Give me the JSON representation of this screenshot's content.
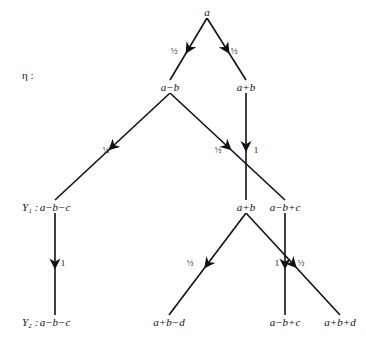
{
  "diagram": {
    "rows": [
      {
        "id": "eta",
        "label": "η :",
        "y": 75
      },
      {
        "id": "y1",
        "label": "Y₁ :",
        "y": 207
      },
      {
        "id": "y2",
        "label": "Y₂ :",
        "y": 322
      }
    ],
    "nodes": [
      {
        "id": "root",
        "label": "a",
        "x": 207,
        "y": 12
      },
      {
        "id": "eta_l",
        "label": "a−b",
        "x": 170,
        "y": 87
      },
      {
        "id": "eta_r",
        "label": "a+b",
        "x": 246,
        "y": 87
      },
      {
        "id": "y1_1",
        "label": "a−b−c",
        "x": 55,
        "y": 207
      },
      {
        "id": "y1_2",
        "label": "a+b",
        "x": 246,
        "y": 207
      },
      {
        "id": "y1_3",
        "label": "a−b+c",
        "x": 285,
        "y": 207
      },
      {
        "id": "y2_1",
        "label": "a−b−c",
        "x": 55,
        "y": 322
      },
      {
        "id": "y2_2",
        "label": "a+b−d",
        "x": 169,
        "y": 322
      },
      {
        "id": "y2_3",
        "label": "a−b+c",
        "x": 285,
        "y": 322
      },
      {
        "id": "y2_4",
        "label": "a+b+d",
        "x": 340,
        "y": 322
      }
    ],
    "edges": [
      {
        "from": "root",
        "to": "eta_l",
        "weight": "½",
        "wx": 174,
        "wy": 51
      },
      {
        "from": "root",
        "to": "eta_r",
        "weight": "½",
        "wx": 234,
        "wy": 51
      },
      {
        "from": "eta_l",
        "to": "y1_1",
        "weight": "½",
        "wx": 106,
        "wy": 150
      },
      {
        "from": "eta_l",
        "to": "y1_3",
        "weight": "½",
        "wx": 218,
        "wy": 150
      },
      {
        "from": "eta_r",
        "to": "y1_2",
        "weight": "1",
        "wx": 256,
        "wy": 150
      },
      {
        "from": "y1_1",
        "to": "y2_1",
        "weight": "1",
        "wx": 63,
        "wy": 263
      },
      {
        "from": "y1_2",
        "to": "y2_2",
        "weight": "½",
        "wx": 190,
        "wy": 263
      },
      {
        "from": "y1_3",
        "to": "y2_3",
        "weight": "1",
        "wx": 277,
        "wy": 263
      },
      {
        "from": "y1_2",
        "to": "y2_4",
        "weight": "½",
        "wx": 301,
        "wy": 263
      }
    ]
  }
}
